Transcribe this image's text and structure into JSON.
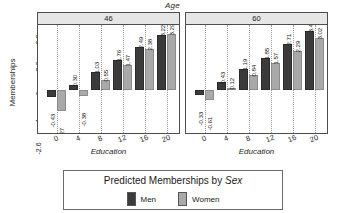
{
  "chart_data": {
    "type": "bar",
    "title": "Age",
    "xlabel": "Education",
    "ylabel": "Memberships",
    "legend_title_prefix": "Predicted Memberships by ",
    "legend_title_em": "Sex",
    "legend_position": "bottom",
    "grid": true,
    "categories": [
      0,
      4,
      8,
      12,
      16,
      20
    ],
    "xtick_labels": [
      "0",
      "4",
      "8",
      "12",
      "16",
      "20"
    ],
    "ytick_labels": [
      "-2.6",
      "-1",
      ".6",
      "2.2",
      "3.8"
    ],
    "ytick_values": [
      -2.6,
      -1,
      0.6,
      2.2,
      3.8
    ],
    "ylim": [
      -2.6,
      3.8
    ],
    "colors": {
      "men": "#3b3b3b",
      "women": "#a9a9a9",
      "panel_header": "#e6e6e6",
      "frame": "#4d4d4d"
    },
    "panel_var": "Age",
    "panels": [
      {
        "label": "46",
        "series": [
          {
            "name": "Men",
            "values": [
              -0.43,
              0.3,
              1.03,
              1.76,
              2.49,
              3.22
            ],
            "labels": [
              "-0.43",
              "0.30",
              "1.03",
              "1.76",
              "2.49",
              "3.22"
            ]
          },
          {
            "name": "Women",
            "values": [
              -1.27,
              -0.38,
              0.55,
              1.47,
              2.38,
              3.29
            ],
            "labels": [
              "-1.27",
              "-0.38",
              "0.55",
              "1.47",
              "2.38",
              "3.29"
            ]
          }
        ]
      },
      {
        "label": "60",
        "series": [
          {
            "name": "Men",
            "values": [
              -0.33,
              0.43,
              1.19,
              1.85,
              2.71,
              3.47
            ],
            "labels": [
              "-0.33",
              "0.43",
              "1.19",
              "1.85",
              "2.71",
              "3.47"
            ]
          },
          {
            "name": "Women",
            "values": [
              -0.61,
              0.12,
              0.84,
              1.57,
              2.29,
              3.02
            ],
            "labels": [
              "-0.61",
              "0.12",
              "0.84",
              "1.57",
              "2.29",
              "3.02"
            ]
          }
        ]
      }
    ],
    "legend_entries": [
      {
        "name": "Men",
        "color": "#3b3b3b"
      },
      {
        "name": "Women",
        "color": "#a9a9a9"
      }
    ]
  }
}
